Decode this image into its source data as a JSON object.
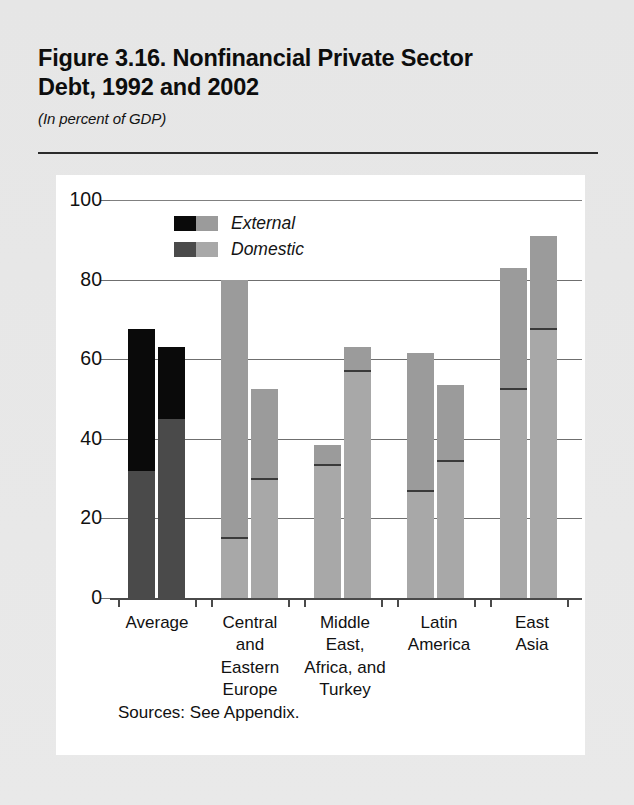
{
  "figure": {
    "title": "Figure 3.16. Nonfinancial Private Sector Debt, 1992 and 2002",
    "title_line1": "Figure 3.16. Nonfinancial Private Sector",
    "title_line2": "Debt, 1992 and 2002",
    "subtitle": "(In percent of GDP)",
    "source": "Sources: See Appendix."
  },
  "legend": {
    "items": [
      {
        "label": "External",
        "color_1992": "#0a0a0a",
        "color_2002": "#9b9b9b"
      },
      {
        "label": "Domestic",
        "color_1992": "#4a4a4a",
        "color_2002": "#a8a8a8"
      }
    ]
  },
  "axis": {
    "y_ticks": [
      "0",
      "20",
      "40",
      "60",
      "80",
      "100"
    ],
    "y_values": [
      0,
      20,
      40,
      60,
      80,
      100
    ]
  },
  "chart_data": {
    "type": "bar",
    "title": "Figure 3.16. Nonfinancial Private Sector Debt, 1992 and 2002",
    "subtitle": "(In percent of GDP)",
    "xlabel": "",
    "ylabel": "In percent of GDP",
    "ylim": [
      0,
      100
    ],
    "grid": true,
    "stacked": true,
    "legend_position": "top-left-inside",
    "categories": [
      "Average",
      "Central and Eastern Europe",
      "Middle East, Africa, and Turkey",
      "Latin America",
      "East Asia"
    ],
    "category_label_lines": [
      [
        "Average"
      ],
      [
        "Central",
        "and",
        "Eastern",
        "Europe"
      ],
      [
        "Middle",
        "East,",
        "Africa, and",
        "Turkey"
      ],
      [
        "Latin",
        "America"
      ],
      [
        "East",
        "Asia"
      ]
    ],
    "series": [
      {
        "name": "Domestic 1992",
        "values": [
          32.0,
          15.0,
          33.5,
          27.0,
          52.5
        ]
      },
      {
        "name": "External 1992",
        "values": [
          35.5,
          65.0,
          5.0,
          34.5,
          30.5
        ]
      },
      {
        "name": "Domestic 2002",
        "values": [
          45.0,
          30.0,
          57.0,
          34.5,
          67.5
        ]
      },
      {
        "name": "External 2002",
        "values": [
          18.0,
          22.5,
          6.0,
          19.0,
          23.5
        ]
      }
    ],
    "totals": {
      "1992": [
        67.5,
        80.0,
        38.5,
        61.5,
        83.0
      ],
      "2002": [
        63.0,
        52.5,
        63.0,
        53.5,
        91.0
      ]
    }
  },
  "groups": [
    {
      "name": "Average",
      "lines": [
        "Average"
      ],
      "center": 47,
      "bars": [
        {
          "year": "1992",
          "x": 18,
          "domestic": 32.0,
          "total": 67.5,
          "shade": "dark"
        },
        {
          "year": "2002",
          "x": 48,
          "domestic": 45.0,
          "total": 63.0,
          "shade": "dark"
        }
      ]
    },
    {
      "name": "Central and Eastern Europe",
      "lines": [
        "Central",
        "and",
        "Eastern",
        "Europe"
      ],
      "center": 140,
      "bars": [
        {
          "year": "1992",
          "x": 111,
          "domestic": 15.0,
          "total": 80.0,
          "shade": "light"
        },
        {
          "year": "2002",
          "x": 141,
          "domestic": 30.0,
          "total": 52.5,
          "shade": "light"
        }
      ]
    },
    {
      "name": "Middle East, Africa, and Turkey",
      "lines": [
        "Middle",
        "East,",
        "Africa, and",
        "Turkey"
      ],
      "center": 235,
      "bars": [
        {
          "year": "1992",
          "x": 204,
          "domestic": 33.5,
          "total": 38.5,
          "shade": "light"
        },
        {
          "year": "2002",
          "x": 234,
          "domestic": 57.0,
          "total": 63.0,
          "shade": "light"
        }
      ]
    },
    {
      "name": "Latin America",
      "lines": [
        "Latin",
        "America"
      ],
      "center": 329,
      "bars": [
        {
          "year": "1992",
          "x": 297,
          "domestic": 27.0,
          "total": 61.5,
          "shade": "light"
        },
        {
          "year": "2002",
          "x": 327,
          "domestic": 34.5,
          "total": 53.5,
          "shade": "light"
        }
      ]
    },
    {
      "name": "East Asia",
      "lines": [
        "East",
        "Asia"
      ],
      "center": 422,
      "bars": [
        {
          "year": "1992",
          "x": 390,
          "domestic": 52.5,
          "total": 83.0,
          "shade": "light"
        },
        {
          "year": "2002",
          "x": 420,
          "domestic": 67.5,
          "total": 91.0,
          "shade": "light"
        }
      ]
    }
  ]
}
